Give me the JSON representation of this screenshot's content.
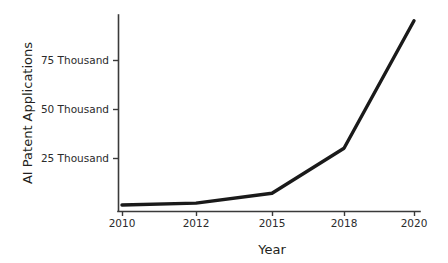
{
  "chart_data": {
    "type": "line",
    "title": "",
    "subtitle": "",
    "xlabel": "Year",
    "ylabel": "AI Patent Applications",
    "categories": [
      "2010",
      "2012",
      "2015",
      "2018",
      "2020"
    ],
    "x": [
      2010,
      2012,
      2015,
      2018,
      2020
    ],
    "values": [
      1000,
      2000,
      7000,
      30000,
      95000
    ],
    "series": [
      {
        "name": "AI Patent Applications",
        "values": [
          1000,
          2000,
          7000,
          30000,
          95000
        ],
        "color": "#1a1a1a"
      }
    ],
    "xtick_labels": [
      "2010",
      "2012",
      "2015",
      "2018",
      "2020"
    ],
    "ytick_labels": [
      "25 Thousand",
      "50 Thousand",
      "75 Thousand"
    ],
    "ytick_values": [
      25000,
      50000,
      75000
    ],
    "ylim": [
      0,
      100000
    ],
    "xlim": [
      2010,
      2020
    ],
    "grid": false,
    "legend": false,
    "legend_position": "none",
    "axis_color": "#3a3a3a",
    "line_color": "#1a1a1a",
    "background_color": "#ffffff",
    "x_axis_scale": "categorical",
    "annotations": []
  },
  "axes": {
    "y_title": "AI Patent Applications",
    "x_title": "Year",
    "y_ticks": [
      {
        "label": "25 Thousand",
        "value": 25000
      },
      {
        "label": "50 Thousand",
        "value": 50000
      },
      {
        "label": "75 Thousand",
        "value": 75000
      }
    ],
    "x_ticks": [
      {
        "label": "2010",
        "value": 2010
      },
      {
        "label": "2012",
        "value": 2012
      },
      {
        "label": "2015",
        "value": 2015
      },
      {
        "label": "2018",
        "value": 2018
      },
      {
        "label": "2020",
        "value": 2020
      }
    ]
  }
}
